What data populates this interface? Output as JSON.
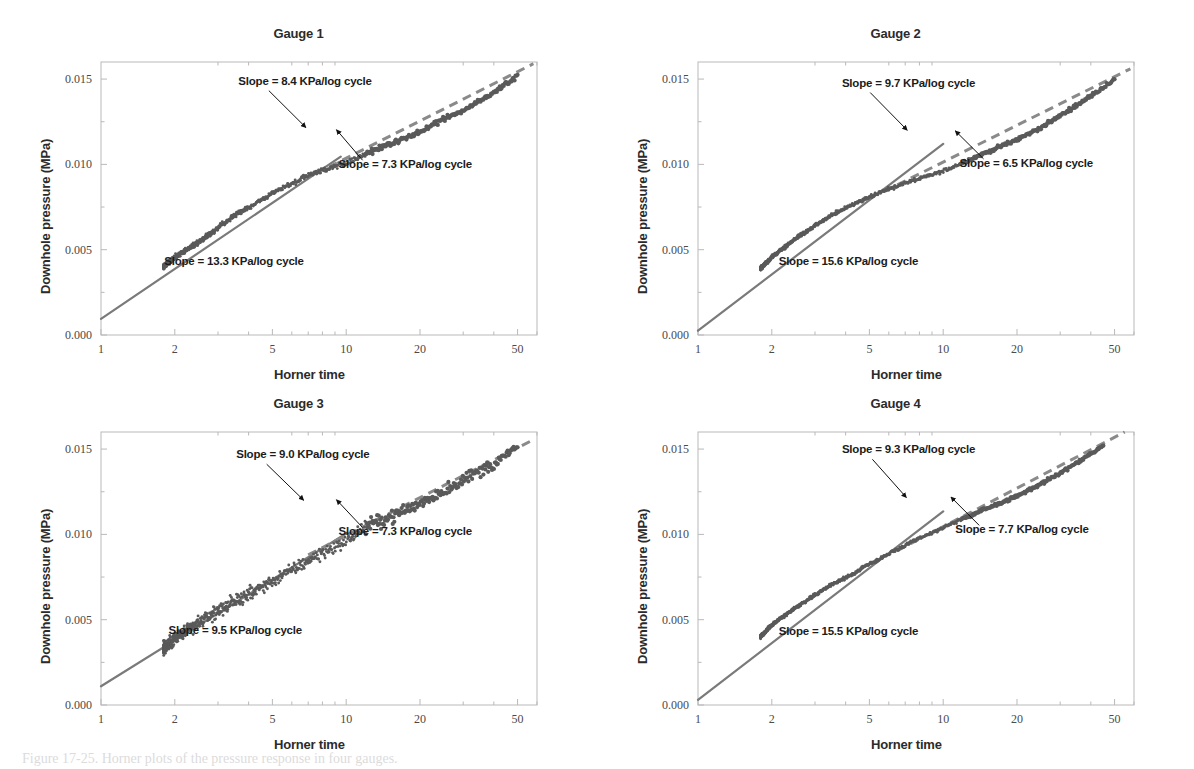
{
  "figure": {
    "caption": "Figure 17-25. Horner plots of the pressure response in four gauges.",
    "axis_titles": {
      "x": "Horner time",
      "y": "Downhole pressure (MPa)"
    },
    "colors": {
      "data_points": "#5a5a5a",
      "fit_line": "#7a7a7a",
      "dashed_line": "#8a8a8a",
      "arrow": "#111111",
      "frame": "#b9b9b9",
      "text": "#1c1c1c"
    }
  },
  "chart_data": {
    "type": "scatter",
    "xlabel": "Horner time",
    "ylabel": "Downhole pressure (MPa)",
    "xscale": "log",
    "xlim": [
      1,
      60
    ],
    "ylim": [
      0.0,
      0.016
    ],
    "xticks": [
      1,
      2,
      5,
      10,
      20,
      50
    ],
    "xticklabels": [
      "1",
      "2",
      "5",
      "10",
      "20",
      "50"
    ],
    "yticks": [
      0.0,
      0.005,
      0.01,
      0.015
    ],
    "yticklabels": [
      "0.000",
      "0.005",
      "0.010",
      "0.015"
    ],
    "grid": false,
    "legend": "none",
    "units": {
      "pressure": "MPa",
      "slope": "KPa/log cycle"
    },
    "panels": [
      {
        "title": "Gauge 1",
        "scatter_start": {
          "x": 1.8,
          "y": 0.004
        },
        "scatter_end": {
          "x": 50.0,
          "y": 0.0152
        },
        "scatter_scatter_band": 0.00022,
        "curve_points": [
          {
            "x": 1.8,
            "y": 0.004
          },
          {
            "x": 2.0,
            "y": 0.00455
          },
          {
            "x": 2.5,
            "y": 0.00545
          },
          {
            "x": 3.0,
            "y": 0.00625
          },
          {
            "x": 3.5,
            "y": 0.007
          },
          {
            "x": 4.0,
            "y": 0.00745
          },
          {
            "x": 5.0,
            "y": 0.0083
          },
          {
            "x": 6.0,
            "y": 0.0089
          },
          {
            "x": 7.0,
            "y": 0.00935
          },
          {
            "x": 8.0,
            "y": 0.00965
          },
          {
            "x": 10.0,
            "y": 0.0101
          },
          {
            "x": 12.0,
            "y": 0.0106
          },
          {
            "x": 15.0,
            "y": 0.01115
          },
          {
            "x": 20.0,
            "y": 0.0119
          },
          {
            "x": 25.0,
            "y": 0.01265
          },
          {
            "x": 30.0,
            "y": 0.0132
          },
          {
            "x": 40.0,
            "y": 0.0142
          },
          {
            "x": 50.0,
            "y": 0.0152
          }
        ],
        "fit_solid": {
          "x0": 1.0,
          "y0": 0.00095,
          "x1": 9.5,
          "y1": 0.01045
        },
        "fit_dashed": {
          "x0": 8.5,
          "y0": 0.00985,
          "x1": 58.0,
          "y1": 0.0159
        },
        "annotations": [
          {
            "id": "slope-mid",
            "label": "Slope = 8.4 KPa/log cycle",
            "value": 8.4,
            "text_x": 0.315,
            "text_y": 0.085,
            "arrow_x0": 0.385,
            "arrow_y0": 0.105,
            "arrow_x1": 0.47,
            "arrow_y1": 0.24
          },
          {
            "id": "slope-late",
            "label": "Slope = 7.3 KPa/log cycle",
            "value": 7.3,
            "text_x": 0.545,
            "text_y": 0.39,
            "arrow_x0": 0.6,
            "arrow_y0": 0.36,
            "arrow_x1": 0.54,
            "arrow_y1": 0.248
          },
          {
            "id": "slope-early",
            "label": "Slope = 13.3 KPa/log cycle",
            "value": 13.3,
            "text_x": 0.145,
            "text_y": 0.742,
            "arrow_x0": null,
            "arrow_y0": null,
            "arrow_x1": null,
            "arrow_y1": null
          }
        ]
      },
      {
        "title": "Gauge 2",
        "scatter_start": {
          "x": 1.8,
          "y": 0.0039
        },
        "scatter_end": {
          "x": 50.0,
          "y": 0.015
        },
        "scatter_scatter_band": 0.00016,
        "curve_points": [
          {
            "x": 1.8,
            "y": 0.0039
          },
          {
            "x": 2.0,
            "y": 0.00455
          },
          {
            "x": 2.5,
            "y": 0.00565
          },
          {
            "x": 3.0,
            "y": 0.0064
          },
          {
            "x": 3.5,
            "y": 0.007
          },
          {
            "x": 4.0,
            "y": 0.00745
          },
          {
            "x": 5.0,
            "y": 0.0081
          },
          {
            "x": 6.0,
            "y": 0.00855
          },
          {
            "x": 7.0,
            "y": 0.0089
          },
          {
            "x": 8.0,
            "y": 0.00915
          },
          {
            "x": 10.0,
            "y": 0.0096
          },
          {
            "x": 12.0,
            "y": 0.0101
          },
          {
            "x": 15.0,
            "y": 0.0107
          },
          {
            "x": 20.0,
            "y": 0.01145
          },
          {
            "x": 25.0,
            "y": 0.01215
          },
          {
            "x": 30.0,
            "y": 0.01285
          },
          {
            "x": 40.0,
            "y": 0.014
          },
          {
            "x": 50.0,
            "y": 0.015
          }
        ],
        "fit_solid": {
          "x0": 1.0,
          "y0": 0.00025,
          "x1": 10.0,
          "y1": 0.0112
        },
        "fit_dashed": {
          "x0": 6.5,
          "y0": 0.0088,
          "x1": 58.0,
          "y1": 0.0156
        },
        "annotations": [
          {
            "id": "slope-mid",
            "label": "Slope = 9.7 KPa/log cycle",
            "value": 9.7,
            "text_x": 0.33,
            "text_y": 0.09,
            "arrow_x0": 0.395,
            "arrow_y0": 0.112,
            "arrow_x1": 0.48,
            "arrow_y1": 0.25
          },
          {
            "id": "slope-late",
            "label": "Slope = 6.5 KPa/log cycle",
            "value": 6.5,
            "text_x": 0.6,
            "text_y": 0.385,
            "arrow_x0": 0.655,
            "arrow_y0": 0.355,
            "arrow_x1": 0.59,
            "arrow_y1": 0.252
          },
          {
            "id": "slope-early",
            "label": "Slope = 15.6 KPa/log cycle",
            "value": 15.6,
            "text_x": 0.185,
            "text_y": 0.745,
            "arrow_x0": null,
            "arrow_y0": null,
            "arrow_x1": null,
            "arrow_y1": null
          }
        ]
      },
      {
        "title": "Gauge 3",
        "scatter_start": {
          "x": 1.8,
          "y": 0.0033
        },
        "scatter_end": {
          "x": 50.0,
          "y": 0.015
        },
        "scatter_scatter_band": 0.00055,
        "curve_points": [
          {
            "x": 1.8,
            "y": 0.0033
          },
          {
            "x": 2.0,
            "y": 0.0039
          },
          {
            "x": 2.5,
            "y": 0.0048
          },
          {
            "x": 3.0,
            "y": 0.00555
          },
          {
            "x": 3.5,
            "y": 0.00605
          },
          {
            "x": 4.0,
            "y": 0.0065
          },
          {
            "x": 5.0,
            "y": 0.00725
          },
          {
            "x": 6.0,
            "y": 0.0079
          },
          {
            "x": 7.0,
            "y": 0.00845
          },
          {
            "x": 8.0,
            "y": 0.0089
          },
          {
            "x": 10.0,
            "y": 0.0096
          },
          {
            "x": 12.0,
            "y": 0.01045
          },
          {
            "x": 15.0,
            "y": 0.011
          },
          {
            "x": 20.0,
            "y": 0.0118
          },
          {
            "x": 25.0,
            "y": 0.01255
          },
          {
            "x": 30.0,
            "y": 0.0132
          },
          {
            "x": 40.0,
            "y": 0.01415
          },
          {
            "x": 50.0,
            "y": 0.01505
          }
        ],
        "fit_solid": {
          "x0": 1.0,
          "y0": 0.0011,
          "x1": 10.0,
          "y1": 0.01005
        },
        "fit_dashed": {
          "x0": 7.0,
          "y0": 0.0088,
          "x1": 58.0,
          "y1": 0.01555
        },
        "annotations": [
          {
            "id": "slope-mid",
            "label": "Slope = 9.0 KPa/log cycle",
            "value": 9.0,
            "text_x": 0.31,
            "text_y": 0.095,
            "arrow_x0": 0.38,
            "arrow_y0": 0.118,
            "arrow_x1": 0.465,
            "arrow_y1": 0.25
          },
          {
            "id": "slope-late",
            "label": "Slope = 7.3 KPa/log cycle",
            "value": 7.3,
            "text_x": 0.545,
            "text_y": 0.378,
            "arrow_x0": 0.6,
            "arrow_y0": 0.35,
            "arrow_x1": 0.54,
            "arrow_y1": 0.248
          },
          {
            "id": "slope-early",
            "label": "Slope = 9.5 KPa/log cycle",
            "value": 9.5,
            "text_x": 0.155,
            "text_y": 0.74,
            "arrow_x0": null,
            "arrow_y0": null,
            "arrow_x1": null,
            "arrow_y1": null
          }
        ]
      },
      {
        "title": "Gauge 4",
        "scatter_start": {
          "x": 1.8,
          "y": 0.004
        },
        "scatter_end": {
          "x": 45.0,
          "y": 0.0152
        },
        "scatter_scatter_band": 0.00014,
        "curve_points": [
          {
            "x": 1.8,
            "y": 0.004
          },
          {
            "x": 2.0,
            "y": 0.0047
          },
          {
            "x": 2.5,
            "y": 0.0057
          },
          {
            "x": 3.0,
            "y": 0.00645
          },
          {
            "x": 3.5,
            "y": 0.00705
          },
          {
            "x": 4.0,
            "y": 0.00745
          },
          {
            "x": 5.0,
            "y": 0.00825
          },
          {
            "x": 6.0,
            "y": 0.00885
          },
          {
            "x": 7.0,
            "y": 0.00935
          },
          {
            "x": 8.0,
            "y": 0.00975
          },
          {
            "x": 10.0,
            "y": 0.0104
          },
          {
            "x": 12.0,
            "y": 0.0109
          },
          {
            "x": 15.0,
            "y": 0.0115
          },
          {
            "x": 20.0,
            "y": 0.01225
          },
          {
            "x": 25.0,
            "y": 0.01295
          },
          {
            "x": 30.0,
            "y": 0.0136
          },
          {
            "x": 40.0,
            "y": 0.0147
          },
          {
            "x": 45.0,
            "y": 0.0152
          }
        ],
        "fit_solid": {
          "x0": 1.0,
          "y0": 0.0003,
          "x1": 10.0,
          "y1": 0.01135
        },
        "fit_dashed": {
          "x0": 6.5,
          "y0": 0.00905,
          "x1": 55.0,
          "y1": 0.016
        },
        "annotations": [
          {
            "id": "slope-mid",
            "label": "Slope = 9.3 KPa/log cycle",
            "value": 9.3,
            "text_x": 0.33,
            "text_y": 0.078,
            "arrow_x0": 0.4,
            "arrow_y0": 0.1,
            "arrow_x1": 0.478,
            "arrow_y1": 0.24
          },
          {
            "id": "slope-late",
            "label": "Slope = 7.7 KPa/log cycle",
            "value": 7.7,
            "text_x": 0.59,
            "text_y": 0.37,
            "arrow_x0": 0.645,
            "arrow_y0": 0.342,
            "arrow_x1": 0.58,
            "arrow_y1": 0.238
          },
          {
            "id": "slope-early",
            "label": "Slope = 15.5 KPa/log cycle",
            "value": 15.5,
            "text_x": 0.185,
            "text_y": 0.742,
            "arrow_x0": null,
            "arrow_y0": null,
            "arrow_x1": null,
            "arrow_y1": null
          }
        ]
      }
    ]
  }
}
